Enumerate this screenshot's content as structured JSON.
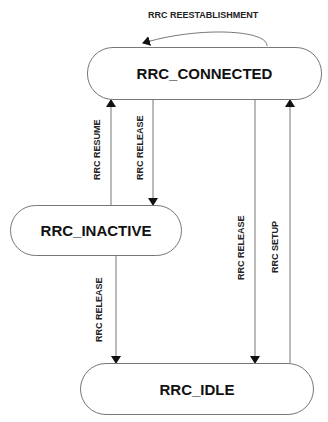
{
  "diagram": {
    "type": "state-machine",
    "states": [
      {
        "id": "connected",
        "label": "RRC_CONNECTED"
      },
      {
        "id": "inactive",
        "label": "RRC_INACTIVE"
      },
      {
        "id": "idle",
        "label": "RRC_IDLE"
      }
    ],
    "transitions": [
      {
        "from": "connected",
        "to": "connected",
        "label": "RRC REESTABLISHMENT"
      },
      {
        "from": "inactive",
        "to": "connected",
        "label": "RRC RESUME"
      },
      {
        "from": "connected",
        "to": "inactive",
        "label": "RRC RELEASE"
      },
      {
        "from": "inactive",
        "to": "idle",
        "label": "RRC RELEASE"
      },
      {
        "from": "connected",
        "to": "idle",
        "label": "RRC RELEASE"
      },
      {
        "from": "idle",
        "to": "connected",
        "label": "RRC SETUP"
      }
    ],
    "colors": {
      "line": "#777777",
      "arrowhead": "#111111",
      "text": "#111111"
    }
  }
}
